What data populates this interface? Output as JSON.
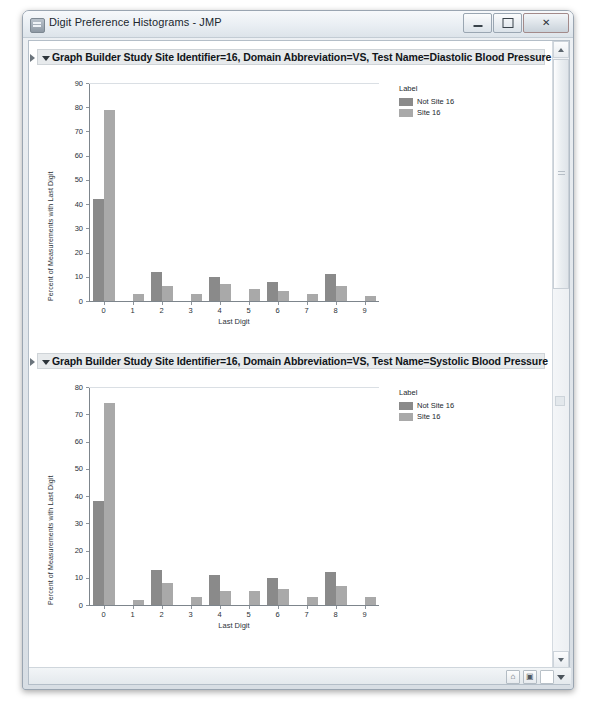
{
  "window": {
    "title": "Digit Preference Histograms - JMP",
    "icon": "jmp-app-icon",
    "controls": {
      "minimize": "–",
      "maximize": "❑",
      "close": "✕"
    }
  },
  "statusbar": {
    "icons": [
      "home-icon",
      "window-icon",
      "blank-icon",
      "caret-down-icon"
    ]
  },
  "scrollbar": {
    "up_arrow": "scroll-up-arrow",
    "down_arrow": "scroll-down-arrow"
  },
  "sections": [
    {
      "title": "Graph Builder Study Site Identifier=16, Domain Abbreviation=VS, Test Name=Diastolic Blood Pressure",
      "chart_index": 0
    },
    {
      "title": "Graph Builder Study Site Identifier=16, Domain Abbreviation=VS, Test Name=Systolic Blood Pressure",
      "chart_index": 1
    }
  ],
  "legend": {
    "title": "Label",
    "entries": [
      {
        "label": "Not Site 16",
        "color": "#8a8a8a"
      },
      {
        "label": "Site 16",
        "color": "#a9a9a9"
      }
    ]
  },
  "chart_data": [
    {
      "type": "bar",
      "title": "Graph Builder Study Site Identifier=16, Domain Abbreviation=VS, Test Name=Diastolic Blood Pressure",
      "xlabel": "Last Digit",
      "ylabel": "Percent of Measurements with Last Digit",
      "categories": [
        "0",
        "1",
        "2",
        "3",
        "4",
        "5",
        "6",
        "7",
        "8",
        "9"
      ],
      "yticks": [
        0,
        10,
        20,
        30,
        40,
        50,
        60,
        70,
        80,
        90
      ],
      "ylim": [
        0,
        90
      ],
      "grid": false,
      "legend_position": "right",
      "series": [
        {
          "name": "Not Site 16",
          "color": "#8a8a8a",
          "values": [
            42,
            0,
            12,
            0,
            10,
            0,
            8,
            0,
            11,
            0
          ]
        },
        {
          "name": "Site 16",
          "color": "#a9a9a9",
          "values": [
            79,
            3,
            6,
            3,
            7,
            5,
            4,
            3,
            6,
            2
          ]
        }
      ]
    },
    {
      "type": "bar",
      "title": "Graph Builder Study Site Identifier=16, Domain Abbreviation=VS, Test Name=Systolic Blood Pressure",
      "xlabel": "Last Digit",
      "ylabel": "Percent of Measurements with Last Digit",
      "categories": [
        "0",
        "1",
        "2",
        "3",
        "4",
        "5",
        "6",
        "7",
        "8",
        "9"
      ],
      "yticks": [
        0,
        10,
        20,
        30,
        40,
        50,
        60,
        70,
        80
      ],
      "ylim": [
        0,
        80
      ],
      "grid": false,
      "legend_position": "right",
      "series": [
        {
          "name": "Not Site 16",
          "color": "#8a8a8a",
          "values": [
            38,
            0,
            13,
            0,
            11,
            0,
            10,
            0,
            12,
            0
          ]
        },
        {
          "name": "Site 16",
          "color": "#a9a9a9",
          "values": [
            74,
            2,
            8,
            3,
            5,
            5,
            6,
            3,
            7,
            3
          ]
        }
      ]
    }
  ]
}
